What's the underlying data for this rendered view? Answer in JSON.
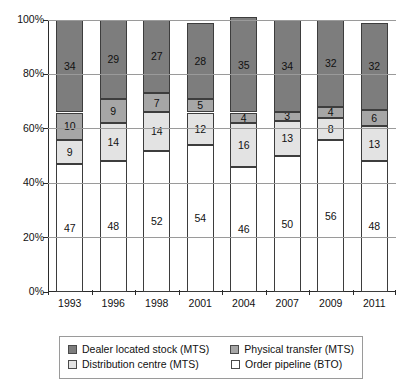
{
  "chart_data": {
    "type": "bar",
    "stacked": true,
    "normalized": true,
    "title": "",
    "xlabel": "",
    "ylabel": "",
    "categories": [
      "1993",
      "1996",
      "1998",
      "2001",
      "2004",
      "2007",
      "2009",
      "2011"
    ],
    "ylim": [
      0,
      100
    ],
    "ytick_labels": [
      "0%",
      "20%",
      "40%",
      "60%",
      "80%",
      "100%"
    ],
    "ytick_values": [
      0,
      20,
      40,
      60,
      80,
      100
    ],
    "grid": true,
    "legend_position": "bottom",
    "series": [
      {
        "name": "Order pipeline (BTO)",
        "color": "#ffffff",
        "values": [
          47,
          48,
          52,
          54,
          46,
          50,
          56,
          48
        ]
      },
      {
        "name": "Distribution centre (MTS)",
        "color": "#e3e3e3",
        "values": [
          9,
          14,
          14,
          12,
          16,
          13,
          8,
          13
        ]
      },
      {
        "name": "Physical transfer (MTS)",
        "color": "#a6a6a6",
        "values": [
          10,
          9,
          7,
          5,
          4,
          3,
          4,
          6
        ]
      },
      {
        "name": "Dealer located stock (MTS)",
        "color": "#7d7d7d",
        "values": [
          34,
          29,
          27,
          28,
          35,
          34,
          32,
          32
        ]
      }
    ]
  },
  "legend": {
    "items": [
      {
        "label": "Dealer located stock (MTS)",
        "color": "#7d7d7d"
      },
      {
        "label": "Physical transfer (MTS)",
        "color": "#a6a6a6"
      },
      {
        "label": "Distribution centre (MTS)",
        "color": "#e3e3e3"
      },
      {
        "label": "Order pipeline (BTO)",
        "color": "#ffffff"
      }
    ]
  },
  "colors": {
    "dealer_located_stock": "#7d7d7d",
    "physical_transfer": "#a6a6a6",
    "distribution_centre": "#e3e3e3",
    "order_pipeline": "#ffffff",
    "axis": "#2b2b2b",
    "gridline": "#9a9a9a",
    "segment_border": "#3d3d3d"
  }
}
